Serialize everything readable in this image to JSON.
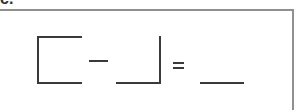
{
  "problem": {
    "label": "c.",
    "equation": {
      "minuend": "",
      "operator": "−",
      "subtrahend": "",
      "equals": "=",
      "answer": ""
    }
  },
  "colors": {
    "frame_border": "#8f8f8f",
    "ink": "#3a3a3a"
  }
}
